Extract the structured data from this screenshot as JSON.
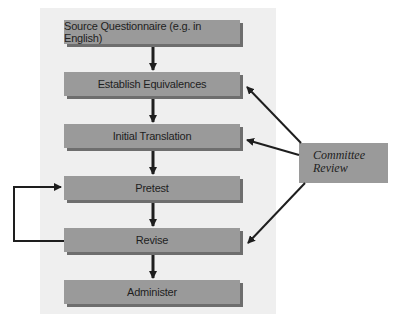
{
  "diagram": {
    "type": "flowchart",
    "steps": [
      {
        "label": "Source Questionnaire (e.g. in English)"
      },
      {
        "label": "Establish Equivalences"
      },
      {
        "label": "Initial Translation"
      },
      {
        "label": "Pretest"
      },
      {
        "label": "Revise"
      },
      {
        "label": "Administer"
      }
    ],
    "side_node": {
      "label_line1": "Committee",
      "label_line2": "Review"
    },
    "edges": [
      {
        "from": "Source Questionnaire (e.g. in English)",
        "to": "Establish Equivalences"
      },
      {
        "from": "Establish Equivalences",
        "to": "Initial Translation"
      },
      {
        "from": "Initial Translation",
        "to": "Pretest"
      },
      {
        "from": "Pretest",
        "to": "Revise"
      },
      {
        "from": "Revise",
        "to": "Administer"
      },
      {
        "from": "Revise",
        "to": "Pretest",
        "note": "feedback loop"
      },
      {
        "from": "Committee Review",
        "to": "Establish Equivalences"
      },
      {
        "from": "Committee Review",
        "to": "Initial Translation"
      },
      {
        "from": "Committee Review",
        "to": "Revise"
      }
    ],
    "colors": {
      "panel_bg": "#efefef",
      "box_fill": "#9a9a9a",
      "box_shadow": "#6e6e6e",
      "arrow": "#1e1e1e"
    }
  }
}
